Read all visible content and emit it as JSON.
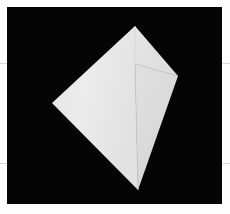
{
  "figure": {
    "canvas": {
      "background_color": "#050505",
      "page_background_color": "#fdfdfd",
      "x": 7,
      "y": 7,
      "width": 215,
      "height": 197
    },
    "guides": [
      {
        "name": "upper-guide",
        "y": 63,
        "color": "#d9d9d9"
      },
      {
        "name": "lower-guide",
        "y": 163,
        "color": "#d9d9d9"
      }
    ],
    "object": {
      "name": "octahedral-solid",
      "description": "Light gray faceted polyhedron, kite-shaped silhouette",
      "vertices": {
        "apex_top": [
          135,
          26
        ],
        "left": [
          52,
          103
        ],
        "right": [
          178,
          76
        ],
        "bottom": [
          138,
          190
        ],
        "interior_junction": [
          135,
          64
        ]
      },
      "faces": [
        {
          "name": "left-face",
          "color": "#e9e9e9",
          "points": "135,26 52,103 138,190 135,64"
        },
        {
          "name": "right-upper-face",
          "color": "#e3e3e3",
          "points": "135,26 178,76 135,64"
        },
        {
          "name": "right-lower-face",
          "color": "#dcdcdc",
          "points": "135,64 178,76 138,190"
        }
      ],
      "edges": [
        {
          "name": "edge-apex-to-junction",
          "color": "#cfcfcf"
        },
        {
          "name": "edge-junction-to-right",
          "color": "#cfcfcf"
        },
        {
          "name": "edge-junction-to-bottom",
          "color": "#cfcfcf"
        }
      ],
      "silhouette_color": "#e9e9e9"
    }
  }
}
